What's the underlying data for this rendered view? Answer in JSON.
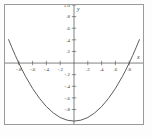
{
  "figure": {
    "axis_x_label": "x",
    "axis_y_label": "y",
    "frame": true
  },
  "chart_data": {
    "type": "line",
    "title": "",
    "xlabel": "x",
    "ylabel": "y",
    "xlim": [
      -1.0,
      1.0
    ],
    "ylim": [
      -1.05,
      1.0
    ],
    "grid": false,
    "legend": null,
    "x_ticks": [
      -0.8,
      -0.6,
      -0.4,
      -0.2,
      0.2,
      0.4,
      0.6,
      0.8
    ],
    "x_tick_labels": [
      "-.8",
      "-.6",
      "-.4",
      "-.2",
      ".2",
      ".4",
      ".6",
      ".8"
    ],
    "y_ticks": [
      -0.8,
      -0.6,
      -0.4,
      -0.2,
      0.2,
      0.4,
      0.6,
      0.8,
      1.0
    ],
    "y_tick_labels": [
      "-.8",
      "-.6",
      "-.4",
      "-.2",
      ".2",
      ".4",
      ".6",
      ".8",
      "1.0"
    ],
    "series": [
      {
        "name": "parabola",
        "color": "#4a4a4a",
        "equation": "y = x^2/0.64 - 1",
        "roots": [
          -0.8,
          0.8
        ],
        "vertex": [
          0,
          -1
        ],
        "x": [
          -0.95,
          -0.9,
          -0.85,
          -0.8,
          -0.75,
          -0.7,
          -0.6,
          -0.5,
          -0.4,
          -0.3,
          -0.2,
          -0.1,
          0,
          0.1,
          0.2,
          0.3,
          0.4,
          0.5,
          0.6,
          0.7,
          0.75,
          0.8,
          0.85,
          0.9,
          0.95
        ],
        "values": [
          0.41,
          0.266,
          0.129,
          0.0,
          -0.121,
          -0.234,
          -0.438,
          -0.609,
          -0.75,
          -0.859,
          -0.938,
          -0.984,
          -1.0,
          -0.984,
          -0.938,
          -0.859,
          -0.75,
          -0.609,
          -0.438,
          -0.234,
          -0.121,
          0.0,
          0.129,
          0.266,
          0.41
        ]
      }
    ]
  }
}
